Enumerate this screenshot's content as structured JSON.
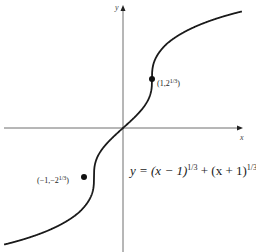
{
  "chart_data": {
    "type": "line",
    "title": "",
    "equation": "y = (x − 1)^{1/3} + (x + 1)^{1/3}",
    "xlabel": "x",
    "ylabel": "y",
    "xlim": [
      -4.2,
      4.4
    ],
    "ylim": [
      -3.1,
      3.2
    ],
    "grid": false,
    "legend": "none",
    "series": [
      {
        "name": "y = (x − 1)^{1/3} + (x + 1)^{1/3}",
        "x": [
          -4.1,
          -3,
          -2,
          -1.5,
          -1,
          -0.5,
          0,
          0.5,
          1,
          1.5,
          2,
          3,
          4.1
        ],
        "y": [
          -3.17,
          -2.85,
          -2.44,
          -2.15,
          -1.26,
          -0.35,
          0,
          0.35,
          1.26,
          2.15,
          2.44,
          2.85,
          3.17
        ]
      }
    ],
    "annotations": [
      {
        "label": "(1, 2^{1/3})",
        "x": 1,
        "y": 1.26
      },
      {
        "label": "(−1, −2^{1/3})",
        "x": -1,
        "y": -1.26
      }
    ]
  },
  "labels": {
    "x_axis": "x",
    "y_axis": "y",
    "point_upper": "(1,2",
    "point_upper_sup": "1/3",
    "point_upper_close": ")",
    "point_lower": "(−1,−2",
    "point_lower_sup": "1/3",
    "point_lower_close": ")",
    "eq_main": "y = (x − 1)",
    "eq_sup1": "1/3",
    "eq_mid": " + (x + 1)",
    "eq_sup2": "1/3"
  }
}
